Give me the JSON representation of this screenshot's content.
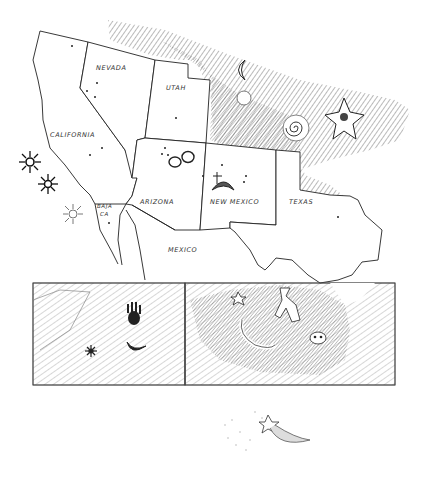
{
  "map": {
    "title": "",
    "style": "pen-and-ink sketch",
    "colors": {
      "ink": "#1a1a1a",
      "paper": "#ffffff",
      "hatch": "#444444"
    },
    "regions": [
      {
        "id": "california",
        "label": "CALIFORNIA"
      },
      {
        "id": "nevada",
        "label": "NEVADA"
      },
      {
        "id": "utah",
        "label": "UTAH"
      },
      {
        "id": "arizona",
        "label": "ARIZONA"
      },
      {
        "id": "new-mexico",
        "label": "NEW MEXICO"
      },
      {
        "id": "texas",
        "label": "TEXAS"
      },
      {
        "id": "baja-california",
        "label_line1": "BAJA",
        "label_line2": "CA"
      },
      {
        "id": "mexico",
        "label": "MEXICO"
      }
    ],
    "petroglyph_motifs": [
      {
        "name": "sun-burst",
        "location": "off California coast"
      },
      {
        "name": "sun-burst",
        "location": "off California coast"
      },
      {
        "name": "sun-burst-sketched",
        "location": "near Baja California"
      },
      {
        "name": "double-ring",
        "location": "Arizona"
      },
      {
        "name": "crescent-moon-figure",
        "location": "New Mexico"
      },
      {
        "name": "crescent",
        "location": "hatched rock area north"
      },
      {
        "name": "spiral",
        "location": "hatched rock area north"
      },
      {
        "name": "star",
        "location": "hatched rock area north-east"
      }
    ]
  },
  "insets": [
    {
      "id": "left-panel",
      "motifs": [
        "hand-print",
        "crescent-moon",
        "star-burst"
      ]
    },
    {
      "id": "right-panel",
      "motifs": [
        "star",
        "lizard-figure",
        "human-figure",
        "face-mask"
      ]
    }
  ],
  "footer_sketch": {
    "name": "comet-shooting-star"
  }
}
